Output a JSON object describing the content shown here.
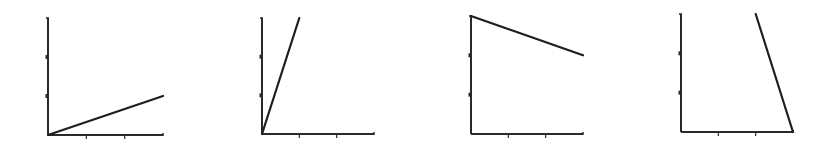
{
  "colors": {
    "background": "#ffffff",
    "axis": "#2a2a2a",
    "line": "#1e1e1e"
  },
  "chart_data": [
    {
      "type": "line",
      "title": "",
      "xlabel": "",
      "ylabel": "",
      "xlim": [
        0,
        3
      ],
      "ylim": [
        0,
        3
      ],
      "x_ticks": [
        1,
        2
      ],
      "y_ticks": [
        1,
        2
      ],
      "grid": false,
      "series": [
        {
          "name": "",
          "x": [
            0,
            3
          ],
          "y": [
            0,
            1
          ]
        }
      ],
      "frame": {
        "ox": 48,
        "oy": 135,
        "w": 115,
        "h": 117
      }
    },
    {
      "type": "line",
      "title": "",
      "xlabel": "",
      "ylabel": "",
      "xlim": [
        0,
        3
      ],
      "ylim": [
        0,
        3
      ],
      "x_ticks": [
        1,
        2
      ],
      "y_ticks": [
        1,
        2
      ],
      "grid": false,
      "series": [
        {
          "name": "",
          "x": [
            0,
            1
          ],
          "y": [
            0,
            3
          ]
        }
      ],
      "frame": {
        "ox": 262,
        "oy": 134,
        "w": 112,
        "h": 116
      }
    },
    {
      "type": "line",
      "title": "",
      "xlabel": "",
      "ylabel": "",
      "xlim": [
        0,
        3
      ],
      "ylim": [
        0,
        3
      ],
      "x_ticks": [
        1,
        2
      ],
      "y_ticks": [
        1,
        2
      ],
      "grid": false,
      "series": [
        {
          "name": "",
          "x": [
            0,
            3
          ],
          "y": [
            3,
            2
          ]
        }
      ],
      "frame": {
        "ox": 471,
        "oy": 134,
        "w": 112,
        "h": 118
      }
    },
    {
      "type": "line",
      "title": "",
      "xlabel": "",
      "ylabel": "",
      "xlim": [
        0,
        3
      ],
      "ylim": [
        0,
        3
      ],
      "x_ticks": [
        1,
        2
      ],
      "y_ticks": [
        1,
        2
      ],
      "grid": false,
      "series": [
        {
          "name": "",
          "x": [
            2,
            3
          ],
          "y": [
            3,
            0
          ]
        }
      ],
      "frame": {
        "ox": 681,
        "oy": 132,
        "w": 112,
        "h": 118
      }
    }
  ]
}
